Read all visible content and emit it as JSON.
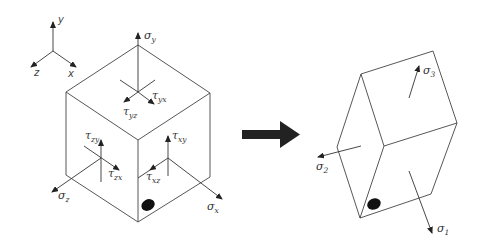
{
  "figure": {
    "axes": {
      "x_label": "x",
      "y_label": "y",
      "z_label": "z"
    },
    "left_cube": {
      "normal_stresses": {
        "sigma_x": {
          "symbol": "σ",
          "sub": "x"
        },
        "sigma_y": {
          "symbol": "σ",
          "sub": "y"
        },
        "sigma_z": {
          "symbol": "σ",
          "sub": "z"
        }
      },
      "shear_stresses": {
        "tau_yx": {
          "symbol": "τ",
          "sub": "yx"
        },
        "tau_yz": {
          "symbol": "τ",
          "sub": "yz"
        },
        "tau_zy": {
          "symbol": "τ",
          "sub": "zy"
        },
        "tau_zx": {
          "symbol": "τ",
          "sub": "zx"
        },
        "tau_xy": {
          "symbol": "τ",
          "sub": "xy"
        },
        "tau_xz": {
          "symbol": "τ",
          "sub": "xz"
        }
      }
    },
    "transform_arrow": "right-arrow",
    "right_cube": {
      "principal_stresses": {
        "sigma_1": {
          "symbol": "σ",
          "sub": "1"
        },
        "sigma_2": {
          "symbol": "σ",
          "sub": "2"
        },
        "sigma_3": {
          "symbol": "σ",
          "sub": "3"
        }
      }
    },
    "colors": {
      "line": "#444444",
      "arrow_fill": "#222222",
      "marker_dot": "#111111",
      "background": "#ffffff"
    }
  }
}
